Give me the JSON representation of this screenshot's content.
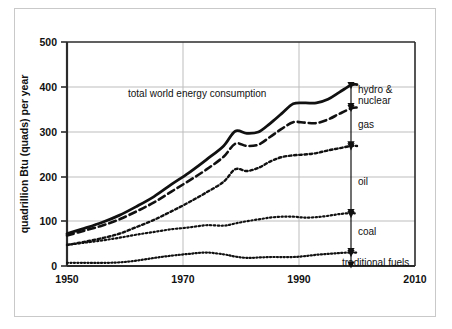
{
  "chart_data": {
    "type": "line",
    "title": "",
    "xlabel": "",
    "ylabel": "quadrillion Btu (quads) per year",
    "xlim": [
      1950,
      2010
    ],
    "ylim": [
      0,
      500
    ],
    "xticks": [
      "1950",
      "1970",
      "1990",
      "2010"
    ],
    "xtick_values": [
      1950,
      1970,
      1990,
      2010
    ],
    "yticks": [
      "0",
      "100",
      "200",
      "300",
      "400",
      "500"
    ],
    "ytick_values": [
      0,
      100,
      200,
      300,
      400,
      500
    ],
    "grid": "horizontal-and-vertical",
    "legend_position": "right-annotations",
    "inline_label": "total world energy consumption",
    "series": [
      {
        "name": "total world energy consumption",
        "style": "solid",
        "x": [
          1950,
          1953,
          1956,
          1959,
          1962,
          1965,
          1968,
          1971,
          1974,
          1977,
          1979,
          1981,
          1983,
          1985,
          1987,
          1989,
          1991,
          1993,
          1995,
          1997,
          1999,
          2000
        ],
        "values": [
          72,
          84,
          97,
          113,
          133,
          155,
          182,
          208,
          237,
          268,
          301,
          296,
          299,
          318,
          340,
          362,
          364,
          364,
          372,
          388,
          404,
          405
        ]
      },
      {
        "name": "hydro & nuclear lower bound (fossil + traditional)",
        "style": "dashed",
        "x": [
          1950,
          1953,
          1956,
          1959,
          1962,
          1965,
          1968,
          1971,
          1974,
          1977,
          1979,
          1981,
          1983,
          1985,
          1987,
          1989,
          1991,
          1993,
          1995,
          1997,
          1999,
          2000
        ],
        "values": [
          68,
          79,
          90,
          104,
          122,
          142,
          166,
          190,
          215,
          244,
          273,
          268,
          271,
          288,
          306,
          321,
          320,
          319,
          327,
          340,
          352,
          354
        ]
      },
      {
        "name": "gas lower bound (oil + coal + traditional)",
        "style": "dotted-coarse",
        "x": [
          1950,
          1953,
          1956,
          1959,
          1962,
          1965,
          1968,
          1971,
          1974,
          1977,
          1979,
          1981,
          1983,
          1985,
          1987,
          1989,
          1991,
          1993,
          1995,
          1997,
          1999,
          2000
        ],
        "values": [
          47,
          54,
          62,
          72,
          87,
          103,
          122,
          142,
          164,
          188,
          216,
          212,
          219,
          233,
          243,
          247,
          249,
          252,
          258,
          263,
          268,
          268
        ]
      },
      {
        "name": "coal lower bound (traditional fuels only, plus coal)",
        "style": "dotted-fine",
        "x": [
          1950,
          1953,
          1956,
          1959,
          1962,
          1965,
          1968,
          1971,
          1974,
          1977,
          1979,
          1981,
          1983,
          1985,
          1987,
          1989,
          1991,
          1993,
          1995,
          1997,
          1999,
          2000
        ],
        "values": [
          47,
          52,
          57,
          63,
          70,
          76,
          82,
          86,
          91,
          90,
          95,
          100,
          104,
          108,
          110,
          110,
          108,
          109,
          112,
          116,
          118,
          117
        ]
      },
      {
        "name": "traditional fuels",
        "style": "dotted-fine",
        "x": [
          1950,
          1953,
          1956,
          1959,
          1962,
          1965,
          1968,
          1971,
          1974,
          1977,
          1979,
          1981,
          1983,
          1985,
          1987,
          1989,
          1991,
          1993,
          1995,
          1997,
          1999,
          2000
        ],
        "values": [
          7,
          7,
          7,
          8,
          12,
          18,
          23,
          27,
          30,
          26,
          21,
          18,
          19,
          20,
          20,
          20,
          22,
          25,
          27,
          29,
          30,
          30
        ]
      }
    ],
    "annotations": [
      {
        "label": "hydro & nuclear",
        "band_top": 405,
        "band_bottom": 354
      },
      {
        "label": "gas",
        "band_top": 354,
        "band_bottom": 268
      },
      {
        "label": "oil",
        "band_top": 268,
        "band_bottom": 117
      },
      {
        "label": "coal",
        "band_top": 117,
        "band_bottom": 30
      },
      {
        "label": "traditional fuels",
        "band_top": 30,
        "band_bottom": 0
      }
    ]
  },
  "axes": {
    "y_title": "quadrillion Btu (quads) per year",
    "y_tick_0": "0",
    "y_tick_100": "100",
    "y_tick_200": "200",
    "y_tick_300": "300",
    "y_tick_400": "400",
    "y_tick_500": "500",
    "x_tick_1950": "1950",
    "x_tick_1970": "1970",
    "x_tick_1990": "1990",
    "x_tick_2010": "2010"
  },
  "labels": {
    "total": "total world energy consumption",
    "hydro_nuclear_line1": "hydro &",
    "hydro_nuclear_line2": "nuclear",
    "gas": "gas",
    "oil": "oil",
    "coal": "coal",
    "traditional": "traditional fuels"
  },
  "colors": {
    "ink": "#111111",
    "grid": "#bdbdbd",
    "axis": "#2b2b2b",
    "frame": "#c9c9c9",
    "background": "#ffffff"
  }
}
